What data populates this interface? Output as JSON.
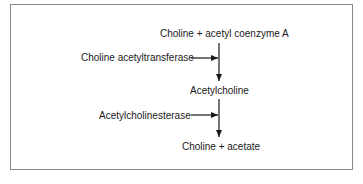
{
  "diagram": {
    "nodes": {
      "substrate": "Choline + acetyl coenzyme A",
      "product": "Acetylcholine",
      "breakdown": "Choline + acetate"
    },
    "enzymes": {
      "synthesis": "Choline acetyltransferase",
      "degradation": "Acetylcholinesterase"
    },
    "edges": [
      {
        "from": "Choline + acetyl coenzyme A",
        "to": "Acetylcholine",
        "enzyme": "Choline acetyltransferase"
      },
      {
        "from": "Acetylcholine",
        "to": "Choline + acetate",
        "enzyme": "Acetylcholinesterase"
      }
    ]
  }
}
